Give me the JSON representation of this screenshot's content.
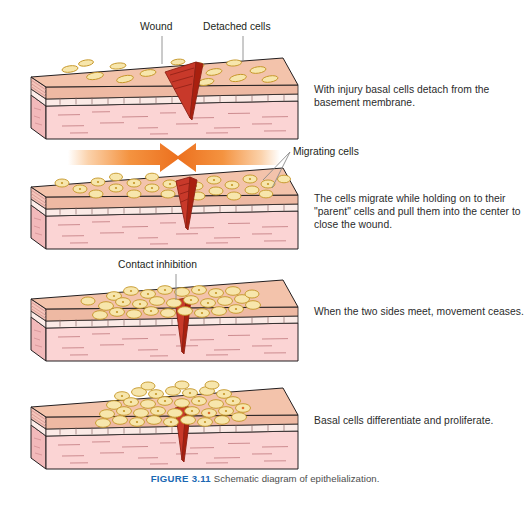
{
  "figure": {
    "caption_label": "FIGURE 3.11",
    "caption_text": "Schematic diagram of epithelialization.",
    "caption_label_color": "#1b68b3"
  },
  "callouts": [
    {
      "id": "wound",
      "label": "Wound"
    },
    {
      "id": "detached",
      "label": "Detached cells"
    },
    {
      "id": "migrating",
      "label": "Migrating cells"
    },
    {
      "id": "contact",
      "label": "Contact inhibition"
    }
  ],
  "panels": [
    {
      "index": 1,
      "text": "With injury basal cells detach from the basement membrane.",
      "stage": "detachment",
      "cells": "sparse scattered elongated basal cells on epidermis surface",
      "wound": "open wedge-shaped wound splitting the block",
      "arrows": false
    },
    {
      "index": 2,
      "text": "The cells migrate while holding on to their \"parent\" cells and pull them into the center to close the wound.",
      "stage": "migration",
      "cells": "rounded cells migrating toward wound from both sides",
      "wound": "narrow wedge-shaped wound",
      "arrows": true
    },
    {
      "index": 3,
      "text": "When the two sides meet, movement ceases.",
      "stage": "contact-inhibition",
      "cells": "dense sheet of cells meeting over the wound",
      "wound": "narrow closed wedge wound",
      "arrows": false
    },
    {
      "index": 4,
      "text": "Basal cells differentiate and proliferate.",
      "stage": "proliferation",
      "cells": "thick multilayered mound of cells over closed wound",
      "wound": "narrow closed wedge wound",
      "arrows": false
    }
  ],
  "arrows": {
    "left_arrow_direction": "right",
    "right_arrow_direction": "left",
    "color": "#ef7622"
  },
  "colors": {
    "epidermis_top": "#f3c3ab",
    "dermis_fill": "#f8cfcf",
    "dermis_side": "#f3bcbc",
    "basement_membrane": "#fbe3e0",
    "wound_dark": "#b02418",
    "wound_light": "#d94632",
    "cell_fill": "#f6e3a8",
    "cell_stroke": "#c79a26",
    "outline": "#231f20",
    "leader_line": "#7a7a7a",
    "arrow": "#ef7622",
    "background": "#ffffff"
  }
}
